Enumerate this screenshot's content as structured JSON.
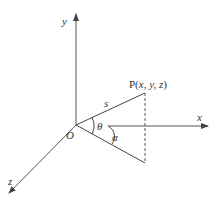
{
  "diagram": {
    "title": "",
    "axes": {
      "x_label": "x",
      "y_label": "y",
      "z_label": "z"
    },
    "origin_label": "O",
    "point": {
      "label_prefix": "P(",
      "label_text": "x, y, z",
      "label_suffix": ")",
      "full_label": "P(x, y, z)"
    },
    "segment_label": "s",
    "angles": {
      "theta": "θ",
      "alpha": "α"
    },
    "colors": {
      "stroke": "#444444",
      "text": "#333333",
      "background": "#ffffff"
    }
  }
}
